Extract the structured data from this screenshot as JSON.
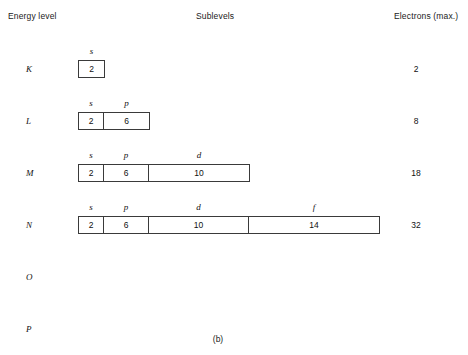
{
  "headers": {
    "energy_level": "Energy level",
    "sublevels": "Sublevels",
    "electrons_max": "Electrons (max.)"
  },
  "caption": "(b)",
  "chart_data": {
    "type": "table",
    "columns": [
      "Energy level",
      "Sublevels",
      "Electrons (max.)"
    ],
    "sublevel_order": [
      "s",
      "p",
      "d",
      "f"
    ],
    "sublevel_capacity": {
      "s": 2,
      "p": 6,
      "d": 10,
      "f": 14
    },
    "rows": [
      {
        "shell": "K",
        "sublevels": [
          {
            "letter": "s",
            "electrons": "2"
          }
        ],
        "electrons_max": "2"
      },
      {
        "shell": "L",
        "sublevels": [
          {
            "letter": "s",
            "electrons": "2"
          },
          {
            "letter": "p",
            "electrons": "6"
          }
        ],
        "electrons_max": "8"
      },
      {
        "shell": "M",
        "sublevels": [
          {
            "letter": "s",
            "electrons": "2"
          },
          {
            "letter": "p",
            "electrons": "6"
          },
          {
            "letter": "d",
            "electrons": "10"
          }
        ],
        "electrons_max": "18"
      },
      {
        "shell": "N",
        "sublevels": [
          {
            "letter": "s",
            "electrons": "2"
          },
          {
            "letter": "p",
            "electrons": "6"
          },
          {
            "letter": "d",
            "electrons": "10"
          },
          {
            "letter": "f",
            "electrons": "14"
          }
        ],
        "electrons_max": "32"
      },
      {
        "shell": "O",
        "sublevels": [],
        "electrons_max": ""
      },
      {
        "shell": "P",
        "sublevels": [],
        "electrons_max": ""
      }
    ]
  },
  "layout": {
    "row_tops": [
      52,
      104,
      156,
      208,
      260,
      312
    ],
    "label_offset_y": 12,
    "bar_offset_y": 8,
    "cell_widths_px": {
      "s": 25,
      "p": 45,
      "d": 100,
      "f": 130
    }
  }
}
